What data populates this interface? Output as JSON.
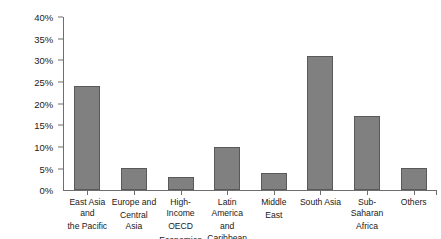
{
  "chart_data": {
    "type": "bar",
    "title": "",
    "xlabel": "",
    "ylabel": "",
    "ylim": [
      0,
      40
    ],
    "grid": false,
    "legend": "none",
    "unit": "%",
    "categories": [
      "East Asia and the Pacific",
      "Europe and Central Asia",
      "High-Income OECD Economies",
      "Latin America and Caribbean",
      "Middle East",
      "South Asia",
      "Sub-Saharan Africa",
      "Others"
    ],
    "category_lines": [
      [
        "East Asia and",
        "the Pacific"
      ],
      [
        "Europe and",
        "Central Asia"
      ],
      [
        "High-Income",
        "OECD",
        "Economies"
      ],
      [
        "Latin America",
        "and Caribbean"
      ],
      [
        "Middle",
        "East"
      ],
      [
        "South Asia"
      ],
      [
        "Sub-Saharan",
        "Africa"
      ],
      [
        "Others"
      ]
    ],
    "values": [
      24,
      5,
      3,
      10,
      4,
      31,
      17,
      5
    ],
    "ytick_labels": [
      "40%",
      "35%",
      "30%",
      "25%",
      "20%",
      "15%",
      "10%",
      "5%",
      "0%"
    ],
    "ytick_values": [
      40,
      35,
      30,
      25,
      20,
      15,
      10,
      5,
      0
    ],
    "colors": {
      "bar_fill": "#808080",
      "bar_stroke": "#595959",
      "axis": "#6e6e6e",
      "text": "#1a1a1a",
      "background": "#ffffff"
    }
  }
}
